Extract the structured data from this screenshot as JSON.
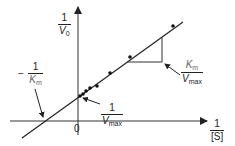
{
  "chart_data": {
    "type": "line",
    "xlabel": {
      "num": "1",
      "den": "[S]"
    },
    "ylabel": {
      "num": "1",
      "den_var": "V",
      "den_sub": "0"
    },
    "origin_label": "0",
    "annotations": {
      "x_intercept": {
        "sign": "−",
        "num": "1",
        "den_var": "K",
        "den_sub": "m"
      },
      "y_intercept": {
        "num": "1",
        "den_var": "V",
        "den_sub": "max"
      },
      "slope": {
        "num_var": "K",
        "num_sub": "m",
        "den_var": "V",
        "den_sub": "max"
      }
    },
    "series": [
      {
        "name": "data points",
        "points_px": [
          [
            80,
            96
          ],
          [
            83,
            94
          ],
          [
            86,
            91
          ],
          [
            90,
            88
          ],
          [
            97,
            86
          ],
          [
            110,
            73
          ],
          [
            130,
            57
          ],
          [
            173,
            26
          ]
        ]
      }
    ],
    "fit_line_px": [
      [
        22,
        138
      ],
      [
        183,
        22
      ]
    ],
    "axes_px": {
      "y_axis_x": 78,
      "x_axis_y": 121
    },
    "legend": "none",
    "grid": false,
    "colors": {
      "line": "#222222",
      "text": "#222222",
      "km_text": "#666666"
    }
  }
}
